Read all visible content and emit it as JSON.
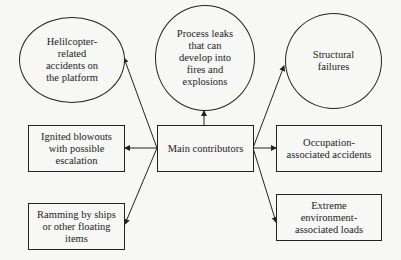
{
  "diagram": {
    "center": {
      "label": "Main contributors"
    },
    "nodes": [
      {
        "id": "helicopter",
        "shape": "ellipse",
        "label": "Helilcopter-\nrelated\naccidents on\nthe platform"
      },
      {
        "id": "process-leaks",
        "shape": "ellipse",
        "label": "Process leaks\nthat can\ndevelop into\nfires and\nexplosions"
      },
      {
        "id": "structural",
        "shape": "ellipse",
        "label": "Structural\nfailures"
      },
      {
        "id": "blowouts",
        "shape": "box",
        "label": "Ignited blowouts\nwith possible\nescalation"
      },
      {
        "id": "ramming",
        "shape": "box",
        "label": "Ramming by ships\nor other floating\nitems"
      },
      {
        "id": "occupation",
        "shape": "box",
        "label": "Occupation-\nassociated accidents"
      },
      {
        "id": "extreme",
        "shape": "box",
        "label": "Extreme\nenvironment-\nassociated loads"
      }
    ],
    "edges": [
      {
        "from": "center",
        "to": "helicopter"
      },
      {
        "from": "center",
        "to": "process-leaks"
      },
      {
        "from": "center",
        "to": "structural"
      },
      {
        "from": "center",
        "to": "blowouts"
      },
      {
        "from": "center",
        "to": "ramming"
      },
      {
        "from": "center",
        "to": "occupation"
      },
      {
        "from": "center",
        "to": "extreme"
      }
    ],
    "colors": {
      "stroke": "#222222",
      "background": "#f7f7f5",
      "text": "#1c1c1c"
    }
  }
}
